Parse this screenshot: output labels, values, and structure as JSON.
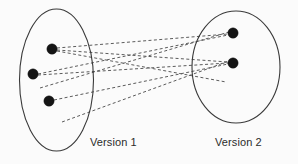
{
  "figure": {
    "background_color": "#fbfbfb",
    "width": 298,
    "height": 164,
    "colors": {
      "ellipse_stroke": "#3a3a3a",
      "line_stroke": "#5b5b5b",
      "dot_fill": "#141414",
      "label_color": "#2b2b2b"
    }
  },
  "sets": [
    {
      "id": "version-1",
      "label": "Version 1",
      "label_x": 90,
      "label_y": 137,
      "ellipse": {
        "cx": 56.5,
        "cy": 80,
        "rx": 37,
        "ry": 71
      },
      "nodes": [
        {
          "id": "v1-n1",
          "cx": 52,
          "cy": 49,
          "r": 5.2
        },
        {
          "id": "v1-n2",
          "cx": 33,
          "cy": 74,
          "r": 5.2
        },
        {
          "id": "v1-n3",
          "cx": 49,
          "cy": 101,
          "r": 5.2
        }
      ]
    },
    {
      "id": "version-2",
      "label": "Version 2",
      "label_x": 215,
      "label_y": 137,
      "ellipse": {
        "cx": 236,
        "cy": 67,
        "rx": 44,
        "ry": 56
      },
      "nodes": [
        {
          "id": "v2-n1",
          "cx": 233,
          "cy": 33,
          "r": 5.2
        },
        {
          "id": "v2-n2",
          "cx": 233,
          "cy": 63,
          "r": 5.2
        }
      ]
    }
  ],
  "free_endpoints": [
    {
      "id": "fe-left-mid",
      "x": 40,
      "y": 88
    },
    {
      "id": "fe-left-low",
      "x": 62,
      "y": 122
    },
    {
      "id": "fe-right-low",
      "x": 226,
      "y": 82
    }
  ],
  "links": [
    {
      "id": "link-1",
      "from": "v1-n1",
      "to": "v2-n1",
      "x1": 57,
      "y1": 48,
      "x2": 228,
      "y2": 34
    },
    {
      "id": "link-2",
      "from": "v1-n1",
      "to": "v2-n2",
      "x1": 57,
      "y1": 50,
      "x2": 228,
      "y2": 62
    },
    {
      "id": "link-3",
      "from": "v1-n2",
      "to": "v2-n1",
      "x1": 38,
      "y1": 74,
      "x2": 228,
      "y2": 35
    },
    {
      "id": "link-4",
      "from": "v1-n2",
      "to": "v2-n2",
      "x1": 38,
      "y1": 75,
      "x2": 228,
      "y2": 63
    },
    {
      "id": "link-5",
      "from": "v1-n3",
      "to": "v2-n2",
      "x1": 54,
      "y1": 100,
      "x2": 228,
      "y2": 64
    },
    {
      "id": "link-6",
      "from": "fe-left-mid",
      "to": "v2-n1",
      "x1": 40,
      "y1": 88,
      "x2": 229,
      "y2": 32
    },
    {
      "id": "link-7",
      "from": "fe-left-low",
      "to": "v2-n2",
      "x1": 62,
      "y1": 122,
      "x2": 229,
      "y2": 61
    },
    {
      "id": "link-8",
      "from": "v1-n1",
      "to": "fe-right-low",
      "x1": 57,
      "y1": 51,
      "x2": 226,
      "y2": 82
    }
  ]
}
